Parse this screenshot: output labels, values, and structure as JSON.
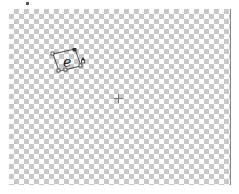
{
  "canvas": {
    "background": "transparent-checkerboard",
    "checker_colors": [
      "#ffffff",
      "#c8c8c8"
    ]
  },
  "selection": {
    "icon": "rotated-selection-with-handles",
    "glyph": "e",
    "cursor": "rotate-cursor-icon"
  },
  "crosshair": {
    "icon": "crosshair-icon"
  }
}
